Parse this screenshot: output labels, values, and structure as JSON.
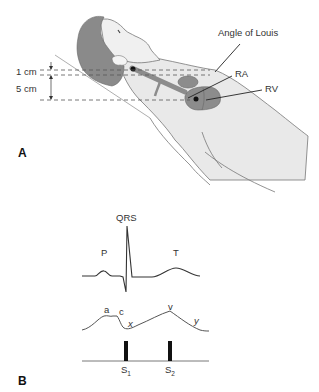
{
  "panel_a": {
    "letter": "A",
    "labels": {
      "angle_of_louis": "Angle of Louis",
      "ra": "RA",
      "rv": "RV",
      "dist_1": "1 cm",
      "dist_2": "5 cm"
    }
  },
  "panel_b": {
    "letter": "B",
    "ecg_labels": {
      "p": "P",
      "qrs": "QRS",
      "t": "T"
    },
    "jvp_labels": {
      "a": "a",
      "c": "c",
      "x": "x",
      "v": "v",
      "y": "y"
    },
    "heart_sounds": [
      {
        "base": "S",
        "sub": "1"
      },
      {
        "base": "S",
        "sub": "2"
      }
    ]
  },
  "colors": {
    "skin": "#e9e9e9",
    "hair": "#8a8a8a",
    "heart": "#8c8c8c",
    "line": "#555555",
    "dark": "#111111"
  }
}
